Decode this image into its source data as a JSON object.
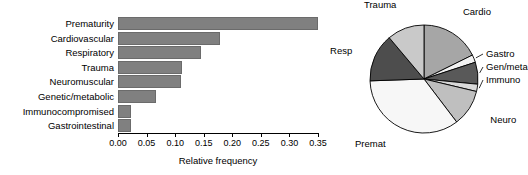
{
  "figure": {
    "background": "#ffffff",
    "bar_fill": "#808080",
    "bar_stroke": "#6b6b6b"
  },
  "chart_data": [
    {
      "type": "bar",
      "orientation": "horizontal",
      "title": "",
      "xlabel": "Relative frequency",
      "ylabel": "",
      "xlim": [
        0.0,
        0.36
      ],
      "grid": false,
      "legend": "none",
      "categories": [
        "Prematurity",
        "Cardiovascular",
        "Respiratory",
        "Trauma",
        "Neuromuscular",
        "Genetic/metabolic",
        "Immunocompromised",
        "Gastrointestinal"
      ],
      "values": [
        0.35,
        0.178,
        0.145,
        0.112,
        0.11,
        0.066,
        0.022,
        0.023
      ],
      "xticks": [
        0.0,
        0.05,
        0.1,
        0.15,
        0.2,
        0.25,
        0.3,
        0.35
      ],
      "xticklabels": [
        "0.00",
        "0.05",
        "0.10",
        "0.15",
        "0.20",
        "0.25",
        "0.30",
        "0.35"
      ]
    },
    {
      "type": "pie",
      "title": "",
      "start_angle_deg": 90,
      "direction": "clockwise",
      "labels": [
        "Cardio",
        "Gastro",
        "Gen/meta",
        "Immuno",
        "Neuro",
        "Premat",
        "Resp",
        "Trauma"
      ],
      "values": [
        0.178,
        0.023,
        0.066,
        0.022,
        0.11,
        0.35,
        0.145,
        0.112
      ],
      "slice_colors": [
        "#a6a6a6",
        "#f2f2f2",
        "#595959",
        "#d9d9d9",
        "#bfbfbf",
        "#f7f7f7",
        "#4d4d4d",
        "#c9c9c9"
      ],
      "label_positions": {
        "Cardio": "upper-right",
        "Gastro": "right",
        "Gen/meta": "right",
        "Immuno": "right",
        "Neuro": "lower-right",
        "Premat": "lower-left",
        "Resp": "left",
        "Trauma": "upper-left"
      }
    }
  ]
}
